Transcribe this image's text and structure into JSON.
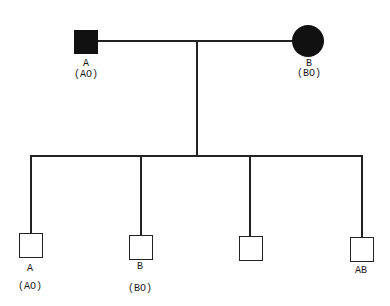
{
  "pedigree": {
    "father": {
      "symbol": "square",
      "affected": true,
      "phenotype": "A",
      "genotype": "(AO)"
    },
    "mother": {
      "symbol": "circle",
      "affected": true,
      "phenotype": "B",
      "genotype": "(BO)"
    },
    "children": [
      {
        "symbol": "square",
        "affected": false,
        "phenotype": "A",
        "genotype": "(AO)"
      },
      {
        "symbol": "square",
        "affected": false,
        "phenotype": "B",
        "genotype": "(BO)"
      },
      {
        "symbol": "square",
        "affected": false,
        "phenotype": "",
        "genotype": ""
      },
      {
        "symbol": "square",
        "affected": false,
        "phenotype": "AB",
        "genotype": ""
      }
    ]
  }
}
